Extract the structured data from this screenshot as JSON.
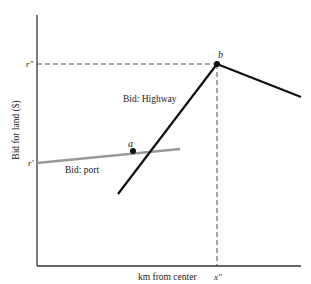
{
  "diagram": {
    "y_axis_label": "Bid for land ($)",
    "x_axis_label": "km from center",
    "y_ticks": {
      "r_double_prime": "r″",
      "r_prime": "r′"
    },
    "x_ticks": {
      "x_double_prime": "x″"
    },
    "points": {
      "a": "a",
      "b": "b"
    },
    "curves": {
      "highway": "Bid: Highway",
      "port": "Bid: port"
    },
    "colors": {
      "highway": "#111111",
      "port": "#999999",
      "axis": "#333333",
      "dashed": "#555555"
    }
  }
}
